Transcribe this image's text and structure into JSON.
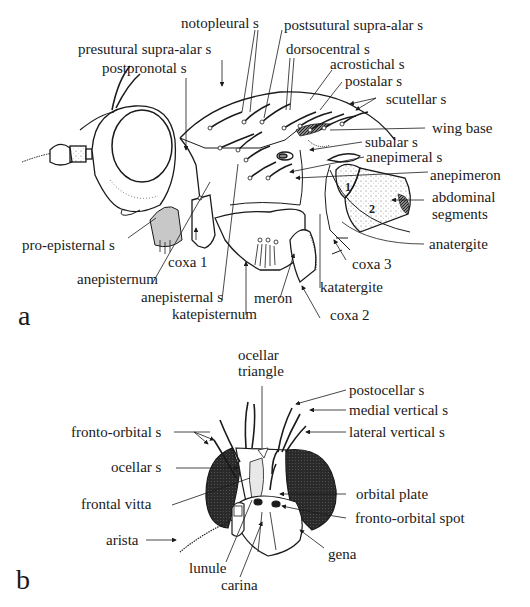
{
  "figure": {
    "panel_a": {
      "letter": "a",
      "subject": "fly thorax, lateral view",
      "labels": {
        "notopleural_s": "notopleural s",
        "postsutural_supra_alar_s": "postsutural supra-alar s",
        "presutural_supra_alar_s": "presutural supra-alar s",
        "dorsocentral_s": "dorsocentral s",
        "postpronotal_s": "postpronotal s",
        "acrostichal_s": "acrostichal s",
        "postalar_s": "postalar s",
        "scutellar_s": "scutellar s",
        "wing_base": "wing base",
        "subalar_s": "subalar s",
        "anepimeral_s": "anepimeral s",
        "anepimeron": "anepimeron",
        "abdominal_segments_1": "abdominal",
        "abdominal_segments_2": "segments",
        "pro_episternal_s": "pro-episternal s",
        "anatergite": "anatergite",
        "coxa_1": "coxa 1",
        "coxa_3": "coxa 3",
        "anepisternum": "anepisternum",
        "katatergite": "katatergite",
        "anepisternal_s": "anepisternal s",
        "meron": "meron",
        "coxa_2": "coxa 2",
        "katepisternum": "katepisternum"
      },
      "segment_numbers": [
        "1",
        "2"
      ]
    },
    "panel_b": {
      "letter": "b",
      "subject": "fly head, frontal view",
      "labels": {
        "ocellar_triangle_1": "ocellar",
        "ocellar_triangle_2": "triangle",
        "postocellar_s": "postocellar s",
        "medial_vertical_s": "medial vertical s",
        "fronto_orbital_s": "fronto-orbital s",
        "lateral_vertical_s": "lateral vertical s",
        "ocellar_s": "ocellar s",
        "frontal_vitta": "frontal vitta",
        "orbital_plate": "orbital plate",
        "fronto_orbital_spot": "fronto-orbital spot",
        "arista": "arista",
        "gena": "gena",
        "lunule": "lunule",
        "carina": "carina"
      }
    },
    "colors": {
      "ink": "#1a1a1a",
      "shade_grey": "#c8c8c8",
      "eye_dark": "#2a2a2a",
      "background": "#ffffff"
    }
  }
}
